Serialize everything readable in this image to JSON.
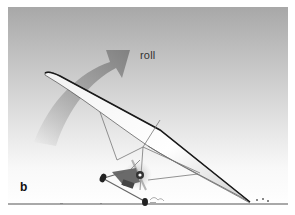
{
  "figure": {
    "panel_label": "b",
    "annotation": "roll",
    "colors": {
      "sky_top": "#a8a8a8",
      "sky_mid": "#d8d8d8",
      "sky_bottom": "#ffffff",
      "arrow": "#8a8a8a",
      "wing_edge": "#1a1a1a",
      "ground": "#555555"
    },
    "icons": {
      "roll_arrow": "curved-arrow-up-right"
    }
  }
}
